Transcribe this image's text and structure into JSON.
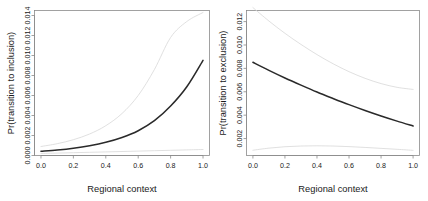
{
  "figure": {
    "panel_count": 2,
    "background": "#ffffff"
  },
  "chart_data": [
    {
      "type": "line",
      "panel": "left",
      "title": "",
      "xlabel": "Regional context",
      "ylabel": "Pr(transition to inclusion)",
      "xlim": [
        -0.04,
        1.04
      ],
      "ylim": [
        0.0,
        0.0145
      ],
      "xticks": [
        0.0,
        0.2,
        0.4,
        0.6,
        0.8,
        1.0
      ],
      "xticklabels": [
        "0.0",
        "0.2",
        "0.4",
        "0.6",
        "0.8",
        "1.0"
      ],
      "yticks": [
        0.0,
        0.002,
        0.004,
        0.006,
        0.008,
        0.01,
        0.012,
        0.014
      ],
      "yticklabels": [
        "0.000",
        "0.002",
        "0.004",
        "0.006",
        "0.008",
        "0.010",
        "0.012",
        "0.014"
      ],
      "grid": false,
      "legend": "none",
      "series": [
        {
          "name": "predicted probability",
          "style": "solid-dark",
          "color": "#2a2a2a",
          "x": [
            0.0,
            0.1,
            0.2,
            0.3,
            0.4,
            0.5,
            0.6,
            0.7,
            0.8,
            0.9,
            1.0
          ],
          "values": [
            0.00042,
            0.00055,
            0.00073,
            0.00098,
            0.00132,
            0.0018,
            0.00248,
            0.00348,
            0.00495,
            0.00688,
            0.00952
          ]
        },
        {
          "name": "upper confidence bound",
          "style": "solid-faint",
          "color": "#d8d8d8",
          "x": [
            0.0,
            0.1,
            0.2,
            0.3,
            0.4,
            0.5,
            0.6,
            0.7,
            0.8,
            0.9,
            1.0
          ],
          "values": [
            0.0009,
            0.00118,
            0.00158,
            0.00215,
            0.00298,
            0.0042,
            0.006,
            0.0086,
            0.0118,
            0.0134,
            0.0143
          ]
        },
        {
          "name": "lower confidence bound",
          "style": "solid-faint",
          "color": "#d8d8d8",
          "x": [
            0.0,
            0.1,
            0.2,
            0.3,
            0.4,
            0.5,
            0.6,
            0.7,
            0.8,
            0.9,
            1.0
          ],
          "values": [
            0.00021,
            0.00024,
            0.00028,
            0.00032,
            0.00036,
            0.0004,
            0.00044,
            0.00048,
            0.00052,
            0.00056,
            0.0006
          ]
        }
      ]
    },
    {
      "type": "line",
      "panel": "right",
      "title": "",
      "xlabel": "Regional context",
      "ylabel": "Pr(transition to exclusion)",
      "xlim": [
        -0.04,
        1.04
      ],
      "ylim": [
        0.00055,
        0.01295
      ],
      "xticks": [
        0.0,
        0.2,
        0.4,
        0.6,
        0.8,
        1.0
      ],
      "xticklabels": [
        "0.0",
        "0.2",
        "0.4",
        "0.6",
        "0.8",
        "1.0"
      ],
      "yticks": [
        0.002,
        0.004,
        0.006,
        0.008,
        0.01,
        0.012
      ],
      "yticklabels": [
        "0.002",
        "0.004",
        "0.006",
        "0.008",
        "0.010",
        "0.012"
      ],
      "grid": false,
      "legend": "none",
      "series": [
        {
          "name": "predicted probability",
          "style": "solid-dark",
          "color": "#2a2a2a",
          "x": [
            0.0,
            0.1,
            0.2,
            0.3,
            0.4,
            0.5,
            0.6,
            0.7,
            0.8,
            0.9,
            1.0
          ],
          "values": [
            0.00852,
            0.00783,
            0.00718,
            0.00657,
            0.00598,
            0.00543,
            0.0049,
            0.0044,
            0.00393,
            0.00349,
            0.00308
          ]
        },
        {
          "name": "upper confidence bound",
          "style": "solid-faint",
          "color": "#d8d8d8",
          "x": [
            0.0,
            0.1,
            0.2,
            0.3,
            0.4,
            0.5,
            0.6,
            0.7,
            0.8,
            0.9,
            1.0
          ],
          "values": [
            0.0132,
            0.01205,
            0.011,
            0.01005,
            0.00918,
            0.0084,
            0.00772,
            0.00715,
            0.0067,
            0.00638,
            0.0062
          ]
        },
        {
          "name": "lower confidence bound",
          "style": "solid-faint",
          "color": "#d8d8d8",
          "x": [
            0.0,
            0.1,
            0.2,
            0.3,
            0.4,
            0.5,
            0.6,
            0.7,
            0.8,
            0.9,
            1.0
          ],
          "values": [
            0.001,
            0.00118,
            0.0013,
            0.00136,
            0.00138,
            0.00136,
            0.00131,
            0.00124,
            0.00116,
            0.00108,
            0.00099
          ]
        }
      ]
    }
  ]
}
